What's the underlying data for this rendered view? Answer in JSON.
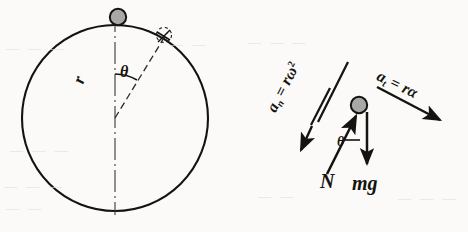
{
  "figure": {
    "type": "physics-free-body-diagram",
    "background_color": "#fbfaf8",
    "ink_color": "#15130f",
    "bead_fill_color": "#a8a8a8"
  },
  "left_diagram": {
    "name": "hoop-diagram",
    "circle": {
      "cx": 115,
      "cy": 118,
      "r": 93
    },
    "bead": {
      "cx": 118,
      "cy": 17,
      "r": 8
    },
    "center_line": {
      "style": "dash-dot",
      "x": 115,
      "y1": 12,
      "y2": 214
    },
    "radius_line": {
      "style": "dashed",
      "x1": 115,
      "y1": 118,
      "x2": 166,
      "y2": 34,
      "angle_from_vertical_deg": 31
    },
    "angle_arc": {
      "label": "θ",
      "radius": 44
    },
    "labels": {
      "radius": "r",
      "angle": "θ"
    }
  },
  "right_diagram": {
    "name": "free-body-diagram",
    "bead": {
      "cx": 359,
      "cy": 105,
      "r": 8
    },
    "vectors": [
      {
        "name": "normal-acceleration",
        "label_base": "a",
        "label_sub": "n",
        "label_eq": "=",
        "label_rhs": "rω",
        "label_sup": "2",
        "label_full": "aₙ = rω²",
        "direction": "down-left",
        "x1": 338,
        "y1": 78,
        "x2": 305,
        "y2": 143
      },
      {
        "name": "tangential-acceleration",
        "label_base": "a",
        "label_sub": "t",
        "label_eq": "=",
        "label_rhs": "rα",
        "label_sup": "",
        "label_full": "aₜ = rα",
        "direction": "down-right",
        "x1": 378,
        "y1": 88,
        "x2": 444,
        "y2": 123
      },
      {
        "name": "normal-force",
        "label_base": "N",
        "label_full": "N",
        "direction": "up-right",
        "x1": 330,
        "y1": 170,
        "x2": 357,
        "y2": 115
      },
      {
        "name": "weight-force",
        "label_base": "mg",
        "label_full": "mg",
        "direction": "down",
        "x1": 368,
        "y1": 113,
        "x2": 368,
        "y2": 165
      }
    ],
    "angle_label": "θ",
    "labels": {
      "normal_force": "N",
      "weight": "mg",
      "angle": "θ"
    }
  },
  "bleed_text": {
    "items": [
      {
        "text": "—  —  —",
        "x": 6,
        "y": 48
      },
      {
        "text": "—  —",
        "x": 170,
        "y": 44
      },
      {
        "text": "—   —  —",
        "x": 10,
        "y": 150
      },
      {
        "text": "—  —  —",
        "x": 4,
        "y": 186
      },
      {
        "text": "—  —",
        "x": 6,
        "y": 208
      },
      {
        "text": "—  —  —",
        "x": 248,
        "y": 42
      },
      {
        "text": "—  —",
        "x": 258,
        "y": 196
      },
      {
        "text": "—  —  —",
        "x": 398,
        "y": 198
      }
    ]
  }
}
